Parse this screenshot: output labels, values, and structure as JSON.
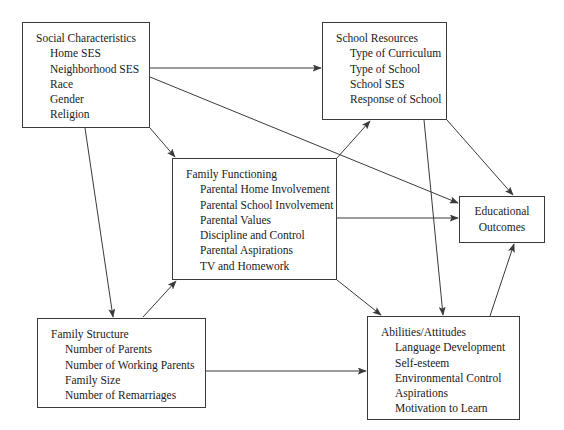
{
  "diagram": {
    "line_color": "#3a3a3a",
    "text_color": "#1a1a1a",
    "background": "#ffffff",
    "nodes": {
      "social_characteristics": {
        "title": "Social Characteristics",
        "items": [
          "Home SES",
          "Neighborhood SES",
          "Race",
          "Gender",
          "Religion"
        ]
      },
      "school_resources": {
        "title": "School Resources",
        "items": [
          "Type of Curriculum",
          "Type of School",
          "School SES",
          "Response of School"
        ]
      },
      "family_functioning": {
        "title": "Family Functioning",
        "items": [
          "Parental Home Involvement",
          "Parental School Involvement",
          "Parental Values",
          "Discipline and Control",
          "Parental Aspirations",
          "TV and Homework"
        ]
      },
      "educational_outcomes": {
        "line1": "Educational",
        "line2": "Outcomes"
      },
      "family_structure": {
        "title": "Family Structure",
        "items": [
          "Number of Parents",
          "Number of Working Parents",
          "Family Size",
          "Number of Remarriages"
        ]
      },
      "abilities_attitudes": {
        "title": "Abilities/Attitudes",
        "items": [
          "Language Development",
          "Self-esteem",
          "Environmental Control",
          "Aspirations",
          "Motivation to Learn"
        ]
      }
    },
    "edges": [
      {
        "name": "social-to-school",
        "from": "social_characteristics",
        "to": "school_resources"
      },
      {
        "name": "social-to-edu-outcomes",
        "from": "social_characteristics",
        "to": "educational_outcomes"
      },
      {
        "name": "social-to-family-functioning",
        "from": "social_characteristics",
        "to": "family_functioning"
      },
      {
        "name": "social-to-family-structure",
        "from": "social_characteristics",
        "to": "family_structure"
      },
      {
        "name": "family-functioning-to-school",
        "from": "family_functioning",
        "to": "school_resources"
      },
      {
        "name": "family-functioning-to-edu-outcomes",
        "from": "family_functioning",
        "to": "educational_outcomes"
      },
      {
        "name": "family-functioning-to-abilities",
        "from": "family_functioning",
        "to": "abilities_attitudes"
      },
      {
        "name": "school-to-edu-outcomes",
        "from": "school_resources",
        "to": "educational_outcomes"
      },
      {
        "name": "school-to-abilities",
        "from": "school_resources",
        "to": "abilities_attitudes"
      },
      {
        "name": "family-structure-to-family-functioning",
        "from": "family_structure",
        "to": "family_functioning"
      },
      {
        "name": "family-structure-to-abilities",
        "from": "family_structure",
        "to": "abilities_attitudes"
      },
      {
        "name": "abilities-to-edu-outcomes",
        "from": "abilities_attitudes",
        "to": "educational_outcomes"
      }
    ]
  }
}
